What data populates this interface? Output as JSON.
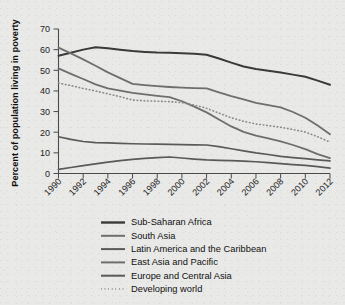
{
  "chart_data": {
    "type": "line",
    "title": "",
    "xlabel": "",
    "ylabel": "Percent of population living in poverty",
    "xlim": [
      1990,
      2012
    ],
    "ylim": [
      0,
      70
    ],
    "ygrid": false,
    "xgrid": false,
    "legend_position": "bottom",
    "yticks": [
      0,
      10,
      20,
      30,
      40,
      50,
      60,
      70
    ],
    "ytick_labels": [
      "0",
      "10",
      "20",
      "30",
      "40",
      "50",
      "60",
      "70"
    ],
    "xticks": [
      1990,
      1992,
      1994,
      1996,
      1998,
      2000,
      2002,
      2004,
      2006,
      2008,
      2010,
      2012
    ],
    "xtick_labels": [
      "1990",
      "1992",
      "1994",
      "1996",
      "1998",
      "2000",
      "2002",
      "2004",
      "2006",
      "2008",
      "2010",
      "2012"
    ],
    "x": [
      1990,
      1991,
      1992,
      1993,
      1994,
      1995,
      1996,
      1997,
      1998,
      1999,
      2000,
      2001,
      2002,
      2003,
      2004,
      2005,
      2006,
      2007,
      2008,
      2009,
      2010,
      2011,
      2012
    ],
    "series": [
      {
        "name": "Sub-Saharan Africa",
        "color": "#3a3a3a",
        "width": 2.0,
        "style": "solid",
        "values": [
          57.0,
          58.5,
          60.0,
          61.2,
          60.7,
          60.0,
          59.3,
          58.9,
          58.6,
          58.5,
          58.3,
          58.0,
          57.5,
          55.7,
          53.7,
          51.8,
          50.6,
          49.8,
          48.9,
          47.9,
          46.9,
          45.0,
          43.0
        ]
      },
      {
        "name": "South Asia",
        "color": "#6e6e6e",
        "width": 1.8,
        "style": "solid",
        "values": [
          61.0,
          58.2,
          55.3,
          52.2,
          49.0,
          46.2,
          43.4,
          42.8,
          42.3,
          41.9,
          41.6,
          41.4,
          41.2,
          39.3,
          37.5,
          35.9,
          34.2,
          33.1,
          32.0,
          29.8,
          27.0,
          23.2,
          19.0
        ]
      },
      {
        "name": "Latin America and the Caribbean",
        "color": "#5a5a5a",
        "width": 1.7,
        "style": "solid",
        "values": [
          17.8,
          16.5,
          15.5,
          15.0,
          14.8,
          14.6,
          14.4,
          14.3,
          14.2,
          14.1,
          14.0,
          13.9,
          13.8,
          13.0,
          12.0,
          11.0,
          10.0,
          9.2,
          8.3,
          7.7,
          7.2,
          6.6,
          6.1
        ]
      },
      {
        "name": "East Asia and Pacific",
        "color": "#6e6e6e",
        "width": 1.8,
        "style": "solid",
        "values": [
          50.9,
          48.3,
          45.8,
          43.2,
          41.2,
          40.2,
          39.1,
          38.3,
          37.6,
          37.0,
          35.0,
          32.4,
          29.6,
          26.2,
          22.8,
          20.2,
          18.4,
          17.0,
          15.6,
          13.8,
          11.8,
          9.4,
          7.5
        ]
      },
      {
        "name": "Europe and Central Asia",
        "color": "#5a5a5a",
        "width": 1.7,
        "style": "solid",
        "values": [
          2.0,
          2.9,
          3.8,
          4.7,
          5.5,
          6.2,
          6.8,
          7.3,
          7.7,
          8.0,
          7.5,
          7.0,
          6.6,
          6.4,
          6.2,
          6.0,
          5.7,
          5.3,
          4.8,
          4.3,
          3.9,
          3.3,
          2.6
        ]
      },
      {
        "name": "Developing world",
        "color": "#8a8a8a",
        "width": 1.6,
        "style": "dotted",
        "values": [
          43.8,
          42.6,
          41.2,
          40.0,
          38.6,
          37.2,
          35.6,
          35.2,
          35.0,
          34.8,
          34.3,
          33.2,
          31.6,
          29.3,
          27.0,
          25.3,
          24.0,
          23.2,
          22.4,
          21.3,
          20.1,
          17.8,
          15.2
        ]
      }
    ]
  },
  "legend": {
    "items": [
      {
        "label": "Sub-Saharan Africa",
        "color": "#3a3a3a",
        "style": "solid",
        "width": 2.4
      },
      {
        "label": "South Asia",
        "color": "#6e6e6e",
        "style": "solid",
        "width": 2.0
      },
      {
        "label": "Latin America and the Caribbean",
        "color": "#5a5a5a",
        "style": "solid",
        "width": 2.0
      },
      {
        "label": "East Asia and Pacific",
        "color": "#6e6e6e",
        "style": "solid",
        "width": 2.0
      },
      {
        "label": "Europe and Central Asia",
        "color": "#5a5a5a",
        "style": "solid",
        "width": 2.0
      },
      {
        "label": "Developing world",
        "color": "#8a8a8a",
        "style": "dotted",
        "width": 1.8
      }
    ]
  },
  "colors": {
    "background": "#e9e9e7",
    "axis": "#4a4a4a",
    "text": "#101010"
  }
}
